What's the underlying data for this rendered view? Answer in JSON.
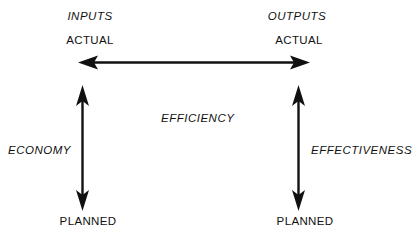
{
  "diagram": {
    "background_color": "#ffffff",
    "ink_color": "#111111",
    "nodes": {
      "inputs_title": "INPUTS",
      "inputs_actual": "ACTUAL",
      "inputs_planned": "PLANNED",
      "outputs_title": "OUTPUTS",
      "outputs_actual": "ACTUAL",
      "outputs_planned": "PLANNED"
    },
    "connectors": {
      "top": {
        "label": "EFFICIENCY",
        "from": "INPUTS ACTUAL",
        "to": "OUTPUTS ACTUAL",
        "orientation": "horizontal",
        "arrowheads": "both"
      },
      "left": {
        "label": "ECONOMY",
        "from": "INPUTS ACTUAL",
        "to": "INPUTS PLANNED",
        "orientation": "vertical",
        "arrowheads": "both"
      },
      "right": {
        "label": "EFFECTIVENESS",
        "from": "OUTPUTS ACTUAL",
        "to": "OUTPUTS PLANNED",
        "orientation": "vertical",
        "arrowheads": "both"
      }
    }
  }
}
